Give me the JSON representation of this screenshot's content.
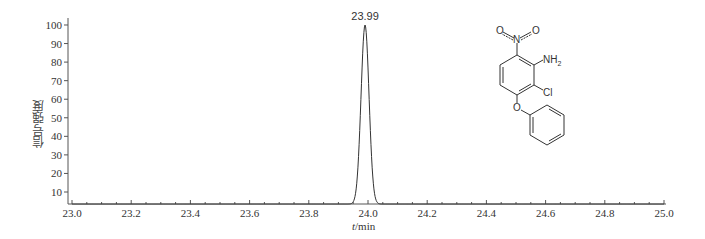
{
  "chart_data": {
    "type": "line",
    "title": "",
    "xlabel_italic": "t",
    "xlabel_rest": "/min",
    "xlabel": "t/min",
    "ylabel": "信号强度",
    "xlim": [
      23.0,
      25.0
    ],
    "ylim": [
      3.5,
      102
    ],
    "x_ticks": [
      "23.0",
      "23.2",
      "23.4",
      "23.6",
      "23.8",
      "24.0",
      "24.2",
      "24.4",
      "24.6",
      "24.8",
      "25.0"
    ],
    "y_ticks": [
      "10",
      "20",
      "30",
      "40",
      "50",
      "60",
      "70",
      "80",
      "90",
      "100"
    ],
    "grid": false,
    "legend": null,
    "series": [
      {
        "name": "chromatogram",
        "color": "#333333",
        "x": [
          23.0,
          23.93,
          23.94,
          23.95,
          23.96,
          23.97,
          23.98,
          23.99,
          24.0,
          24.01,
          24.02,
          24.03,
          24.04,
          25.0
        ],
        "y": [
          3.5,
          3.5,
          5,
          12,
          35,
          70,
          95,
          100,
          92,
          62,
          30,
          10,
          4,
          3.5
        ]
      }
    ],
    "annotations": [
      {
        "text": "23.99",
        "x": 23.99,
        "y": 100,
        "type": "peak-label"
      }
    ]
  },
  "structure": {
    "labels": {
      "nitro_o_left": "O",
      "nitro_o_right": "O",
      "nitro_n": "N",
      "amine": "NH",
      "amine_sub": "2",
      "chloro": "Cl",
      "ether_o": "O"
    },
    "description": "2-chloro-6-nitro-3-phenoxyaniline"
  }
}
